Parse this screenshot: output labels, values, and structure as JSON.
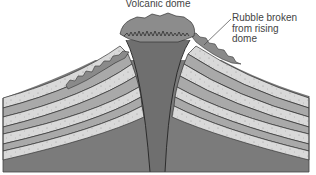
{
  "diagram": {
    "title": "Volcanic dome",
    "annotations": [
      {
        "id": "rubble",
        "lines": [
          "Rubble broken",
          "from rising",
          "dome"
        ]
      }
    ],
    "parts": [
      "volcanic-dome",
      "conduit",
      "rubble",
      "sedimentary-layers",
      "bedrock"
    ]
  },
  "colors": {
    "background": "#ffffff",
    "text": "#444444",
    "bedrock": "#7b7b7b",
    "conduit": "#6f6f6f",
    "dome": "#8c8c8c",
    "layer_light": "#d9d9d9",
    "layer_dark": "#a9a9a9",
    "rubble": "#8a8a8a",
    "outline": "#333333"
  }
}
